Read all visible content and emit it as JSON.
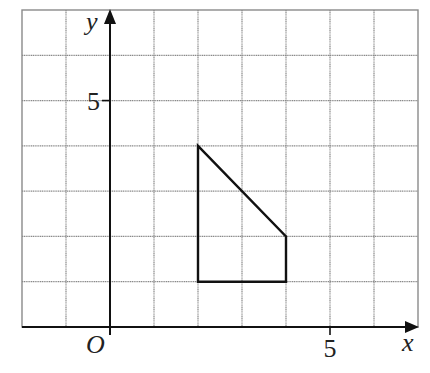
{
  "diagram": {
    "type": "coordinate-grid",
    "x_range": [
      -2,
      7
    ],
    "y_range": [
      0,
      7
    ],
    "grid_step": 1,
    "axes": {
      "x_label": "x",
      "y_label": "y",
      "origin_label": "O"
    },
    "ticks": {
      "x": [
        {
          "value": 5,
          "label": "5"
        }
      ],
      "y": [
        {
          "value": 5,
          "label": "5"
        }
      ]
    },
    "shape": {
      "name": "trapezoid",
      "vertices": [
        [
          2,
          4
        ],
        [
          4,
          2
        ],
        [
          4,
          1
        ],
        [
          2,
          1
        ]
      ]
    },
    "colors": {
      "grid": "#8a8a8a",
      "axes": "#111111",
      "shape": "#111111",
      "background": "#ffffff"
    }
  }
}
